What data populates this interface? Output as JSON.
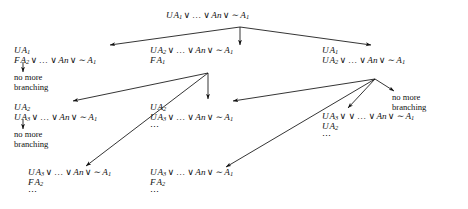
{
  "figure": {
    "type": "proof-tableau-tree",
    "title": "",
    "background": "#ffffff",
    "ink": "#111111"
  },
  "symbols": {
    "or": "∨",
    "not": "∼",
    "ellipsis": "…",
    "vdots": "⋯"
  },
  "nodes": [
    {
      "id": "root",
      "name": "root-node",
      "x": 166,
      "y": 11,
      "lines": [
        {
          "prefix": "U",
          "body": "A1 ∨ … ∨ An ∨ ∼ A1"
        }
      ],
      "text": "U A1 ∨ ... ∨ An ∨ ~ A1"
    },
    {
      "id": "l1-left",
      "name": "level1-left-node",
      "x": 14,
      "y": 46,
      "lines": [
        {
          "prefix": "U",
          "body": "A1"
        },
        {
          "prefix": "F",
          "body": "A2 ∨ … ∨ An ∨ ∼ A1"
        }
      ],
      "text": "U A1 / F A2 ∨ ... ∨ An ∨ ~ A1"
    },
    {
      "id": "l1-mid",
      "name": "level1-middle-node",
      "x": 150,
      "y": 46,
      "lines": [
        {
          "prefix": "U",
          "body": "A2 ∨ … ∨ An ∨ ∼ A1"
        },
        {
          "prefix": "F",
          "body": "A1"
        }
      ],
      "text": "U A2 ∨ ... ∨ An ∨ ~ A1 / F A1"
    },
    {
      "id": "l1-right",
      "name": "level1-right-node",
      "x": 322,
      "y": 46,
      "lines": [
        {
          "prefix": "U",
          "body": "A1"
        },
        {
          "prefix": "U",
          "body": "A2 ∨ … ∨ An ∨ ∼ A1"
        }
      ],
      "text": "U A1 / U A2 ∨ ... ∨ An ∨ ~ A1"
    },
    {
      "id": "l2-left",
      "name": "level2-left-node",
      "x": 14,
      "y": 103,
      "lines": [
        {
          "prefix": "U",
          "body": "A2"
        },
        {
          "prefix": "U",
          "body": "A3 ∨ … ∨ An ∨ ∼ A1"
        }
      ],
      "text": "U A2 / U A3 ∨ ... ∨ An ∨ ~ A1"
    },
    {
      "id": "l2-mid",
      "name": "level2-middle-node",
      "x": 150,
      "y": 103,
      "lines": [
        {
          "prefix": "U",
          "body": "A2"
        },
        {
          "prefix": "U",
          "body": "A3 ∨ … ∨ An ∨ ∼ A1"
        }
      ],
      "trailing_ellipsis": true,
      "text": "U A2 / U A3 ∨ ... ∨ An ∨ ~ A1 / ..."
    },
    {
      "id": "l2-right",
      "name": "level2-right-node",
      "x": 322,
      "y": 112,
      "lines": [
        {
          "prefix": "U",
          "body": "A3 ∨ ∨ … ∨ An ∨ ∼ A1"
        },
        {
          "prefix": "U",
          "body": "A2"
        }
      ],
      "trailing_ellipsis": true,
      "text": "U A3 ∨ ... ∨ An ∨ ~ A1 / U A2 / ..."
    },
    {
      "id": "l3-left",
      "name": "level3-left-node",
      "x": 28,
      "y": 168,
      "lines": [
        {
          "prefix": "U",
          "body": "A3 ∨ … ∨ An ∨ ∼ A1"
        },
        {
          "prefix": "F",
          "body": "A2"
        }
      ],
      "trailing_ellipsis": true,
      "text": "U A3 ∨ ... ∨ An ∨ ~ A1 / F A2 / ..."
    },
    {
      "id": "l3-mid",
      "name": "level3-middle-node",
      "x": 150,
      "y": 168,
      "lines": [
        {
          "prefix": "U",
          "body": "A3 ∨ … ∨ An ∨ ∼ A1"
        },
        {
          "prefix": "F",
          "body": "A2"
        }
      ],
      "trailing_ellipsis": true,
      "text": "U A3 ∨ ... ∨ An ∨ ~ A1 / F A2 / ..."
    }
  ],
  "notes": [
    {
      "id": "note-left-1",
      "name": "no-more-branching-left-upper",
      "x": 14,
      "y": 73,
      "line1": "no more",
      "line2": "branching"
    },
    {
      "id": "note-left-2",
      "name": "no-more-branching-left-lower",
      "x": 14,
      "y": 130,
      "line1": "no more",
      "line2": "branching"
    },
    {
      "id": "note-right-1",
      "name": "no-more-branching-right",
      "x": 392,
      "y": 93,
      "line1": "no more",
      "line2": "branching"
    }
  ],
  "edges": [
    {
      "name": "edge-root-to-left",
      "from": "root",
      "to": "l1-left",
      "x1": 240,
      "y1": 27,
      "x2": 110,
      "y2": 45
    },
    {
      "name": "edge-root-to-middle",
      "from": "root",
      "to": "l1-mid",
      "x1": 240,
      "y1": 27,
      "x2": 240,
      "y2": 45
    },
    {
      "name": "edge-root-to-right",
      "from": "root",
      "to": "l1-right",
      "x1": 240,
      "y1": 27,
      "x2": 371,
      "y2": 45
    },
    {
      "name": "edge-left-to-no-more-1",
      "from": "l1-left",
      "to": "note-left-1",
      "x1": 23,
      "y1": 62,
      "x2": 23,
      "y2": 72
    },
    {
      "name": "edge-mid-fan-to-l2-left",
      "from": "l1-mid",
      "to": "l2-left",
      "x1": 208,
      "y1": 73,
      "x2": 73,
      "y2": 101
    },
    {
      "name": "edge-mid-fan-down",
      "from": "l1-mid",
      "to": "l2-mid",
      "x1": 208,
      "y1": 73,
      "x2": 208,
      "y2": 99
    },
    {
      "name": "edge-mid-fan-to-l3-left",
      "from": "l1-mid",
      "to": "l3-left",
      "x1": 208,
      "y1": 73,
      "x2": 86,
      "y2": 166
    },
    {
      "name": "edge-l2-left-to-no-more",
      "from": "l2-left",
      "to": "note-left-2",
      "x1": 23,
      "y1": 119,
      "x2": 23,
      "y2": 129
    },
    {
      "name": "edge-right-fan-to-l2-left",
      "from": "l1-right",
      "to": "l2-left",
      "x1": 375,
      "y1": 79,
      "x2": 233,
      "y2": 101
    },
    {
      "name": "edge-right-fan-down",
      "from": "l1-right",
      "to": "l2-right",
      "x1": 375,
      "y1": 79,
      "x2": 348,
      "y2": 108
    },
    {
      "name": "edge-right-fan-to-note",
      "from": "l1-right",
      "to": "note-right-1",
      "x1": 375,
      "y1": 79,
      "x2": 394,
      "y2": 91
    },
    {
      "name": "edge-right-fan-to-l3-mid",
      "from": "l1-right",
      "to": "l3-mid",
      "x1": 375,
      "y1": 79,
      "x2": 226,
      "y2": 167
    }
  ]
}
